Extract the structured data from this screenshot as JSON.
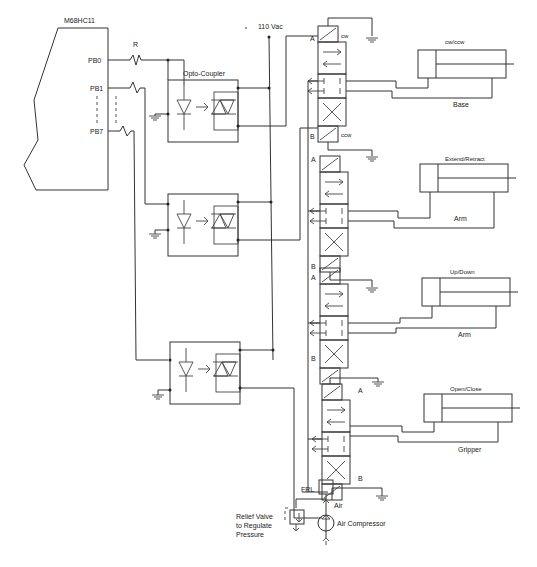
{
  "controller": {
    "name": "M68HC11",
    "pins": [
      "PB0",
      "PB1",
      "PB7"
    ],
    "resistor_label": "R"
  },
  "opto": {
    "label": "Opto-Coupler"
  },
  "power": {
    "label": "110 Vac"
  },
  "valves": [
    {
      "top_label": "A",
      "top_coil": "cw",
      "bottom_label": "B",
      "bottom_coil": "ccw"
    },
    {
      "top_label": "A",
      "bottom_label": "B"
    },
    {
      "top_label": "A",
      "bottom_label": "B"
    },
    {
      "top_label": "A",
      "bottom_label": "B"
    }
  ],
  "cylinders": [
    {
      "function": "cw/ccw",
      "name": "Base"
    },
    {
      "function": "Extend/Retract",
      "name": "Arm"
    },
    {
      "function": "Up/Down",
      "name": "Arm"
    },
    {
      "function": "Open/Close",
      "name": "Gripper"
    }
  ],
  "air_supply": {
    "frl_label": "FRL",
    "air_label": "Air",
    "compressor_label": "Air Compressor",
    "relief_valve_label": [
      "Relief Valve",
      "to Regulate",
      "Pressure"
    ]
  }
}
